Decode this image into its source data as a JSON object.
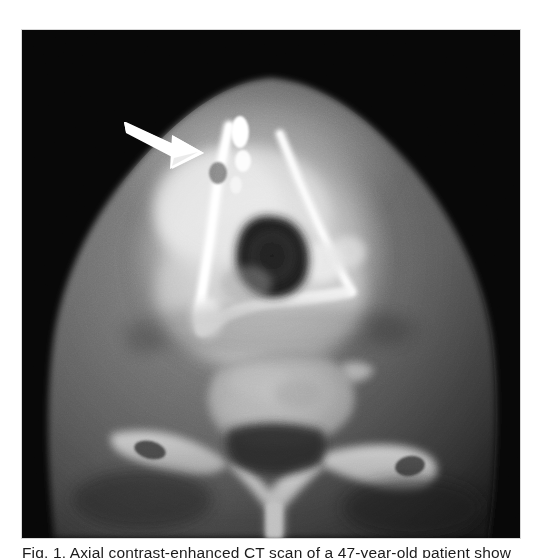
{
  "figure": {
    "modality": "CT",
    "plane": "axial",
    "region": "neck / larynx",
    "caption_text": "Fig. 1. Axial contrast-enhanced CT scan of a 47-year-old patient show",
    "caption_visible_fragment": "cut off at page edge — only ascender tips rendered",
    "background_color": "#ffffff",
    "scan_background_color": "#050505",
    "annotation_color": "#ffffff"
  },
  "scan": {
    "panel": {
      "x": 22,
      "y": 30,
      "width": 498,
      "height": 508
    },
    "body_outline_label": "neck soft-tissue silhouette",
    "structures": [
      {
        "name": "soft-tissue-neck",
        "brightness": "mid-gray",
        "description": "triangular neck cross-section, apex anterior"
      },
      {
        "name": "laryngeal-mass",
        "brightness": "very bright",
        "description": "hyperdense enhancing anterior laryngeal region"
      },
      {
        "name": "thyroid-cartilage",
        "brightness": "bright white",
        "description": "calcified cartilage forming V-shaped lines"
      },
      {
        "name": "airway-lumen",
        "brightness": "dark",
        "description": "central air-filled lumen"
      },
      {
        "name": "vertebral-body",
        "brightness": "light gray",
        "description": "cervical vertebral body, posterior midline"
      },
      {
        "name": "transverse-process-left",
        "brightness": "light gray",
        "description": "left transverse process with foramen"
      },
      {
        "name": "transverse-process-right",
        "brightness": "light gray",
        "description": "right transverse process with foramen"
      },
      {
        "name": "spinous-process",
        "brightness": "light gray",
        "description": "posterior midline spinous process"
      },
      {
        "name": "spinal-canal",
        "brightness": "dark",
        "description": "thecal sac / canal, low density"
      }
    ],
    "annotation": {
      "type": "arrow",
      "color": "#ffffff",
      "points_to": "laryngeal-mass",
      "tail": {
        "x": 124,
        "y": 122
      },
      "tip": {
        "x": 198,
        "y": 153
      },
      "direction": "down-right"
    }
  }
}
